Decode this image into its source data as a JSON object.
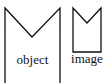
{
  "diagram": {
    "shapes": [
      {
        "id": "object",
        "label": "object",
        "color": "#111111"
      },
      {
        "id": "image",
        "label": "image",
        "color": "#111111"
      }
    ]
  }
}
